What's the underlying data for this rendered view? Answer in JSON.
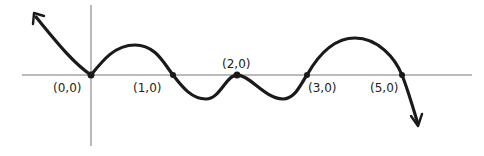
{
  "diagram": {
    "type": "hand-drawn polynomial graph",
    "axes": {
      "x_axis": true,
      "y_axis": true
    },
    "labels": {
      "p0": "(0,0)",
      "p1": "(1,0)",
      "p2": "(2,0)",
      "p3": "(3,0)",
      "p5": "(5,0)"
    },
    "points": [
      {
        "label": "(0,0)",
        "x": 0,
        "y": 0,
        "behavior": "touches (bounces)"
      },
      {
        "label": "(1,0)",
        "x": 1,
        "y": 0,
        "behavior": "crosses"
      },
      {
        "label": "(2,0)",
        "x": 2,
        "y": 0,
        "behavior": "touches (bounces)"
      },
      {
        "label": "(3,0)",
        "x": 3,
        "y": 0,
        "behavior": "crosses"
      },
      {
        "label": "(5,0)",
        "x": 5,
        "y": 0,
        "behavior": "crosses"
      }
    ],
    "end_behavior": {
      "left": "up",
      "right": "down"
    },
    "colors": {
      "curve": "#1a1a1a",
      "axis": "#777777",
      "background": "#ffffff"
    }
  }
}
